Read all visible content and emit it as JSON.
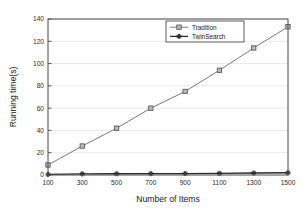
{
  "chart_data": {
    "type": "line",
    "title": "",
    "xlabel": "Number of Items",
    "ylabel": "Running time(s)",
    "x": [
      100,
      300,
      500,
      700,
      900,
      1100,
      1300,
      1500
    ],
    "xtick_labels": [
      "100",
      "300",
      "500",
      "700",
      "900",
      "1100",
      "1300",
      "1500"
    ],
    "ytick_labels": [
      "0",
      "20",
      "40",
      "60",
      "80",
      "100",
      "120",
      "140"
    ],
    "yticks": [
      0,
      20,
      40,
      60,
      80,
      100,
      120,
      140
    ],
    "xlim": [
      100,
      1500
    ],
    "ylim": [
      0,
      140
    ],
    "grid": "horizontal",
    "legend_position": "top-right-inside",
    "series": [
      {
        "name": "Tradition",
        "marker": "square",
        "values": [
          9,
          26,
          42,
          60,
          75,
          94,
          114,
          133
        ]
      },
      {
        "name": "TwinSearch",
        "marker": "star",
        "values": [
          0.5,
          1.0,
          1.1,
          1.2,
          1.3,
          1.5,
          1.8,
          2.0
        ]
      }
    ]
  },
  "legend": {
    "entries": [
      {
        "label": "Tradition"
      },
      {
        "label": "TwinSearch"
      }
    ]
  },
  "axes": {
    "x_title": "Number of Items",
    "y_title": "Running time(s)"
  }
}
